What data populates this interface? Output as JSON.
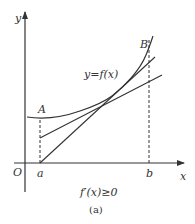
{
  "figure": {
    "caption": "(a)",
    "condition": "f′(x)≥0",
    "function_label": "y=f(x)",
    "axes": {
      "x_label": "x",
      "y_label": "y",
      "origin_label": "O"
    },
    "points": {
      "A": "A",
      "B": "B"
    },
    "ticks": {
      "a": "a",
      "b": "b"
    },
    "colors": {
      "stroke": "#333333",
      "background": "#ffffff"
    }
  }
}
